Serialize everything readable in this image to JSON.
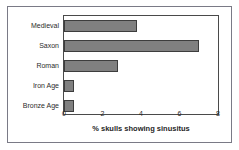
{
  "chart_data": {
    "type": "bar",
    "orientation": "horizontal",
    "title": "",
    "xlabel": "% skulls showing sinusitus",
    "ylabel": "",
    "categories": [
      "Medieval",
      "Saxon",
      "Roman",
      "Iron Age",
      "Bronze Age"
    ],
    "values": [
      3.8,
      7.0,
      2.8,
      0.5,
      0.5
    ],
    "xlim": [
      0,
      8
    ],
    "xticks": [
      0,
      2,
      4,
      6,
      8
    ],
    "xtick_labels": [
      "0",
      "2",
      "4",
      "6",
      "8"
    ],
    "grid": false,
    "legend": false,
    "bar_color": "#808080",
    "bar_edge_color": "#3d3d3d",
    "axis_color": "#4a4a4a",
    "frame_color": "#7a7a86",
    "background": "#ffffff"
  }
}
